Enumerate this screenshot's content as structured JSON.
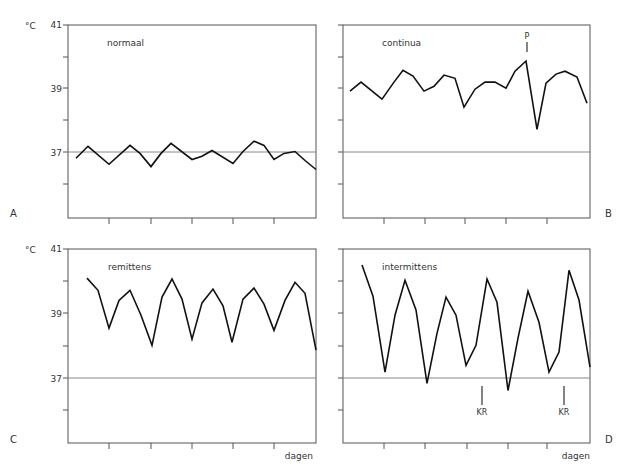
{
  "figure": {
    "unit_label": "°C",
    "x_label": "dagen",
    "normal_line": 37
  },
  "chart_data": [
    {
      "panel": "A",
      "type": "line",
      "title": "normaal",
      "ylabel": "°C",
      "xlabel": "",
      "ylim": [
        35,
        41
      ],
      "yticks": [
        35,
        36,
        37,
        38,
        39,
        40,
        41
      ],
      "ytick_labels": [
        "",
        "",
        "37",
        "",
        "39",
        "",
        "41"
      ],
      "reference_line": 37,
      "x": [
        76,
        88,
        109,
        130,
        140,
        151,
        161,
        171,
        192,
        202,
        212,
        233,
        243,
        254,
        264,
        274,
        284,
        295,
        305,
        316
      ],
      "values": [
        36.85,
        37.22,
        36.66,
        37.25,
        37.0,
        36.59,
        37.0,
        37.31,
        36.81,
        36.91,
        37.09,
        36.69,
        37.06,
        37.38,
        37.25,
        36.81,
        37.0,
        37.06,
        36.78,
        36.5
      ],
      "annotations": []
    },
    {
      "panel": "B",
      "type": "line",
      "title": "continua",
      "ylabel": "",
      "xlabel": "",
      "ylim": [
        35,
        41
      ],
      "yticks": [
        35,
        36,
        37,
        38,
        39,
        40,
        41
      ],
      "ytick_labels": [
        "",
        "",
        "",
        "",
        "",
        "",
        ""
      ],
      "reference_line": 37,
      "x": [
        350,
        361,
        382,
        394,
        403,
        413,
        424,
        434,
        444,
        455,
        464,
        475,
        485,
        495,
        506,
        515,
        526,
        537,
        546,
        556,
        565,
        577,
        587
      ],
      "values": [
        38.94,
        39.22,
        38.69,
        39.22,
        39.59,
        39.41,
        38.94,
        39.09,
        39.44,
        39.34,
        38.44,
        39.0,
        39.22,
        39.22,
        39.03,
        39.56,
        39.88,
        37.75,
        39.19,
        39.47,
        39.56,
        39.38,
        38.56
      ],
      "annotations": [
        {
          "label": "P",
          "x_px": 526
        }
      ]
    },
    {
      "panel": "C",
      "type": "line",
      "title": "remittens",
      "ylabel": "°C",
      "xlabel": "dagen",
      "ylim": [
        35,
        41
      ],
      "yticks": [
        35,
        36,
        37,
        38,
        39,
        40,
        41
      ],
      "ytick_labels": [
        "",
        "",
        "37",
        "",
        "39",
        "",
        "41"
      ],
      "reference_line": 37,
      "x": [
        87,
        98,
        109,
        119,
        130,
        141,
        152,
        162,
        172,
        182,
        192,
        202,
        213,
        223,
        232,
        243,
        254,
        264,
        274,
        285,
        295,
        305,
        316
      ],
      "values": [
        40.1,
        39.72,
        38.55,
        39.41,
        39.72,
        38.95,
        38.02,
        39.51,
        40.07,
        39.45,
        38.21,
        39.33,
        39.76,
        39.24,
        38.11,
        39.45,
        39.79,
        39.29,
        38.48,
        39.41,
        39.97,
        39.63,
        37.87
      ],
      "annotations": []
    },
    {
      "panel": "D",
      "type": "line",
      "title": "intermittens",
      "ylabel": "",
      "xlabel": "dagen",
      "ylim": [
        35,
        41
      ],
      "yticks": [
        35,
        36,
        37,
        38,
        39,
        40,
        41
      ],
      "ytick_labels": [
        "",
        "",
        "",
        "",
        "",
        "",
        ""
      ],
      "reference_line": 37,
      "x": [
        362,
        373,
        385,
        395,
        405,
        416,
        427,
        437,
        446,
        456,
        466,
        476,
        487,
        497,
        508,
        518,
        528,
        539,
        549,
        559,
        569,
        579,
        590
      ],
      "values": [
        40.5,
        39.54,
        37.19,
        38.95,
        40.03,
        39.11,
        36.84,
        38.39,
        39.51,
        38.95,
        37.4,
        38.02,
        40.07,
        39.35,
        36.62,
        38.24,
        39.69,
        38.73,
        37.19,
        37.81,
        40.34,
        39.42,
        37.34
      ],
      "annotations": [
        {
          "label": "KR",
          "x_px": 482
        },
        {
          "label": "KR",
          "x_px": 564
        }
      ]
    }
  ],
  "panels": {
    "A": {
      "letter": "A",
      "title": "normaal",
      "unit": "°C",
      "y41": "41",
      "y39": "39",
      "y37": "37"
    },
    "B": {
      "letter": "B",
      "title": "continua",
      "marker": "P"
    },
    "C": {
      "letter": "C",
      "title": "remittens",
      "unit": "°C",
      "y41": "41",
      "y39": "39",
      "y37": "37",
      "xlabel": "dagen"
    },
    "D": {
      "letter": "D",
      "title": "intermittens",
      "marker1": "KR",
      "marker2": "KR",
      "xlabel": "dagen"
    }
  },
  "colors": {
    "line": "#111111",
    "axis": "#555555",
    "reference": "#777777",
    "text": "#333333"
  }
}
